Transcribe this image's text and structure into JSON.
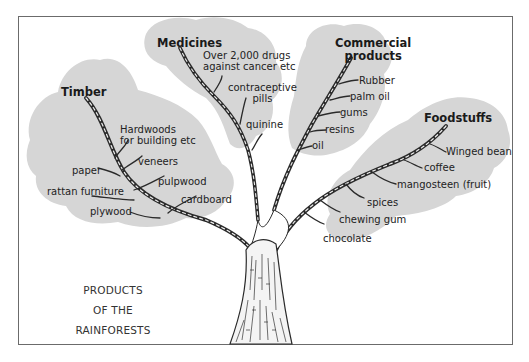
{
  "diagram": {
    "title_lines": [
      "PRODUCTS",
      "OF THE",
      "RAINFORESTS"
    ],
    "colors": {
      "cloud": "#d6d6d6",
      "frame": "#6b6b6b",
      "branch": "#2a2a2a",
      "text": "#1a1a1a"
    },
    "categories": [
      {
        "name": "Timber",
        "items": [
          "Hardwoods",
          "for building etc",
          "veneers",
          "paper",
          "pulpwood",
          "rattan furniture",
          "cardboard",
          "plywood"
        ]
      },
      {
        "name": "Medicines",
        "items": [
          "Over 2,000 drugs",
          "against cancer etc",
          "contraceptive",
          "pills",
          "quinine"
        ]
      },
      {
        "name_lines": [
          "Commercial",
          "products"
        ],
        "items": [
          "Rubber",
          "palm oil",
          "gums",
          "resins",
          "oil"
        ]
      },
      {
        "name": "Foodstuffs",
        "items": [
          "Winged bean",
          "coffee",
          "mangosteen (fruit)",
          "spices",
          "chewing gum",
          "chocolate"
        ]
      }
    ]
  }
}
